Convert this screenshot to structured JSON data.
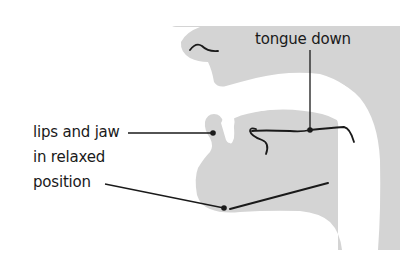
{
  "diagram": {
    "colors": {
      "frame_border": "#6a6a6a",
      "head_fill": "#d4d4d4",
      "background": "#ffffff",
      "line": "#1a1a1a"
    },
    "labels": {
      "tongue": "tongue down",
      "lips_line1": "lips and jaw",
      "lips_line2": "in relaxed",
      "lips_line3": "position"
    },
    "callouts": [
      {
        "label": "tongue down",
        "target": "tongue"
      },
      {
        "label": "lips and jaw in relaxed position",
        "target": "lips"
      },
      {
        "label": "lips and jaw in relaxed position",
        "target": "jaw"
      }
    ]
  }
}
